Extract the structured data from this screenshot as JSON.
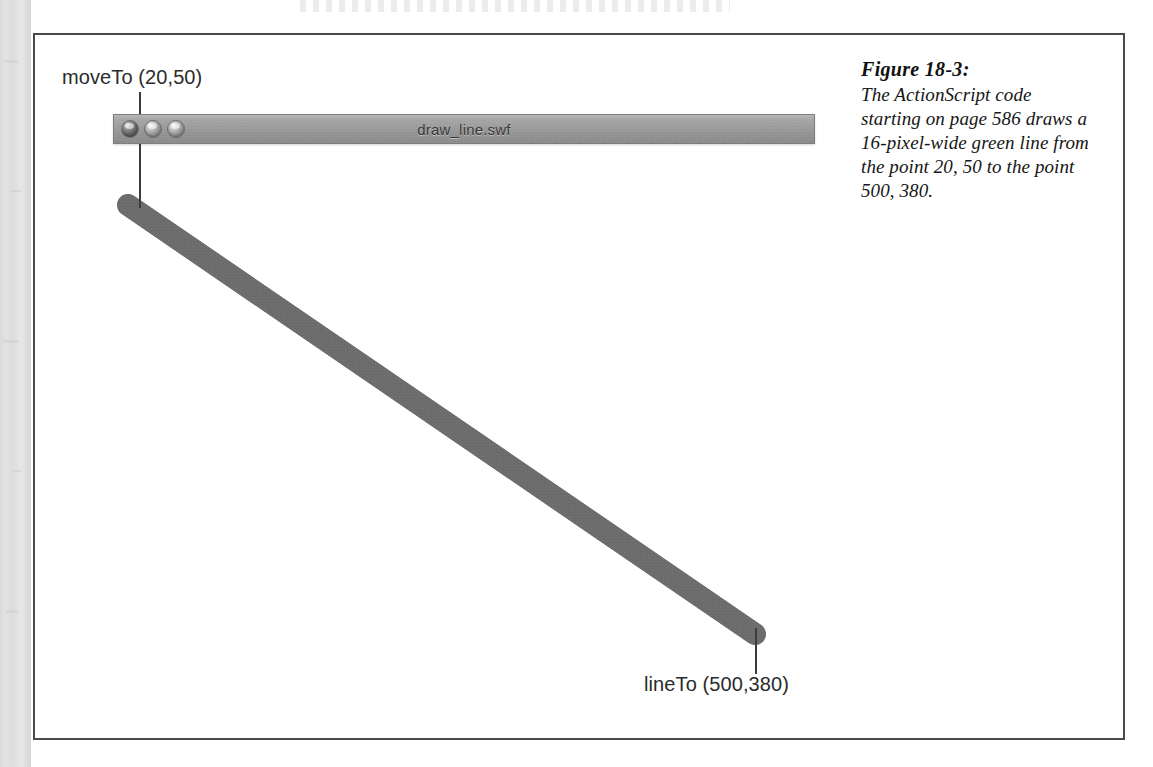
{
  "page": {
    "border_color": "#4a4a4a",
    "background": "#ffffff"
  },
  "window": {
    "title": "draw_line.swf",
    "titlebar_color": "#9a9a9a",
    "controls": [
      {
        "name": "close-button",
        "state": "filled"
      },
      {
        "name": "minimize-button",
        "state": "hollow"
      },
      {
        "name": "zoom-button",
        "state": "hollow"
      }
    ]
  },
  "annotations": [
    {
      "id": "moveto",
      "label": "moveTo (20,50)",
      "command": "moveTo",
      "x": 20,
      "y": 50
    },
    {
      "id": "lineto",
      "label": "lineTo (500,380)",
      "command": "lineTo",
      "x": 500,
      "y": 380
    }
  ],
  "drawing": {
    "line_color": "#6a6a6a",
    "stroke_width_px": 22,
    "cap": "round",
    "start_point": {
      "x": 128,
      "y": 205
    },
    "end_point": {
      "x": 755,
      "y": 634
    },
    "described_width_px": 16,
    "described_color": "green"
  },
  "caption": {
    "title": "Figure 18-3:",
    "body": "The ActionScript code starting on page 586 draws a 16-pixel-wide green line from the point 20, 50 to the point 500, 380."
  }
}
